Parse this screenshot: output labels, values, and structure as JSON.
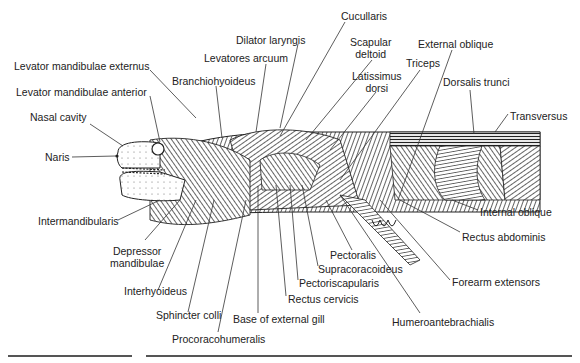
{
  "figure": {
    "labels": [
      {
        "id": "levator-mandibulae-externus",
        "text": "Levator mandibulae externus",
        "x": 14,
        "y": 60
      },
      {
        "id": "levator-mandibulae-anterior",
        "text": "Levator mandibulae anterior",
        "x": 16,
        "y": 86
      },
      {
        "id": "nasal-cavity",
        "text": "Nasal cavity",
        "x": 30,
        "y": 111
      },
      {
        "id": "naris",
        "text": "Naris",
        "x": 45,
        "y": 151
      },
      {
        "id": "intermandibularis",
        "text": "Intermandibularis",
        "x": 38,
        "y": 215
      },
      {
        "id": "depressor-mandibulae",
        "text": "Depressor\nmandibulae",
        "x": 110,
        "y": 245
      },
      {
        "id": "interhyoideus",
        "text": "Interhyoideus",
        "x": 124,
        "y": 285
      },
      {
        "id": "sphincter-colli",
        "text": "Sphincter colli",
        "x": 156,
        "y": 309
      },
      {
        "id": "procoracohumeralis",
        "text": "Procoracohumeralis",
        "x": 172,
        "y": 333
      },
      {
        "id": "base-of-external-gill",
        "text": "Base of external gill",
        "x": 233,
        "y": 313
      },
      {
        "id": "rectus-cervicis",
        "text": "Rectus cervicis",
        "x": 288,
        "y": 293
      },
      {
        "id": "pectoriscapularis",
        "text": "Pectoriscapularis",
        "x": 299,
        "y": 277
      },
      {
        "id": "supracoracoideus",
        "text": "Supracoracoideus",
        "x": 318,
        "y": 263
      },
      {
        "id": "pectoralis",
        "text": "Pectoralis",
        "x": 330,
        "y": 249
      },
      {
        "id": "humeroantebrachialis",
        "text": "Humeroantebrachialis",
        "x": 392,
        "y": 316
      },
      {
        "id": "forearm-extensors",
        "text": "Forearm extensors",
        "x": 452,
        "y": 276
      },
      {
        "id": "rectus-abdominis",
        "text": "Rectus abdominis",
        "x": 462,
        "y": 231
      },
      {
        "id": "internal-oblique",
        "text": "Internal oblique",
        "x": 480,
        "y": 206
      },
      {
        "id": "transversus",
        "text": "Transversus",
        "x": 510,
        "y": 110
      },
      {
        "id": "dorsalis-trunci",
        "text": "Dorsalis trunci",
        "x": 443,
        "y": 76
      },
      {
        "id": "external-oblique",
        "text": "External oblique",
        "x": 418,
        "y": 38
      },
      {
        "id": "triceps",
        "text": "Triceps",
        "x": 406,
        "y": 57
      },
      {
        "id": "latissimus-dorsi",
        "text": "Latissimus\ndorsi",
        "x": 352,
        "y": 70
      },
      {
        "id": "scapular-deltoid",
        "text": "Scapular\ndeltoid",
        "x": 350,
        "y": 36
      },
      {
        "id": "cucullaris",
        "text": "Cucullaris",
        "x": 341,
        "y": 10
      },
      {
        "id": "dilator-laryngis",
        "text": "Dilator laryngis",
        "x": 236,
        "y": 34
      },
      {
        "id": "levatores-arcuum",
        "text": "Levatores arcuum",
        "x": 204,
        "y": 52
      },
      {
        "id": "branchiohyoideus",
        "text": "Branchiohyoideus",
        "x": 172,
        "y": 75
      }
    ]
  },
  "colors": {
    "ink": "#1a1a1a",
    "line": "#333333",
    "background": "#ffffff",
    "rule": "#555555"
  }
}
